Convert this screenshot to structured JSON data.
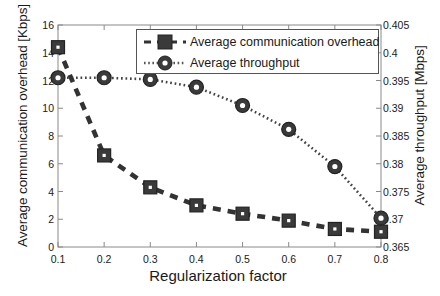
{
  "chart_data": {
    "type": "line",
    "title": "",
    "xlabel": "Regularization factor",
    "ylabel": "Average communication overhead [Kbps]",
    "ylabel_right": "Average throughput [Mbps]",
    "x": [
      0.1,
      0.2,
      0.3,
      0.4,
      0.5,
      0.6,
      0.7,
      0.8
    ],
    "xlim": [
      0.1,
      0.8
    ],
    "ylim": [
      0,
      16
    ],
    "ylim_right": [
      0.365,
      0.405
    ],
    "xticks": [
      "0.1",
      "0.2",
      "0.3",
      "0.4",
      "0.5",
      "0.6",
      "0.7",
      "0.8"
    ],
    "yticks_left": [
      "0",
      "2",
      "4",
      "6",
      "8",
      "10",
      "12",
      "14",
      "16"
    ],
    "yticks_right": [
      "0.365",
      "0.37",
      "0.375",
      "0.38",
      "0.385",
      "0.39",
      "0.395",
      "0.4",
      "0.405"
    ],
    "grid": false,
    "legend_position": "top-center",
    "series": [
      {
        "name": "Average communication overhead",
        "axis": "left",
        "marker": "square",
        "linestyle": "dashed",
        "color": "#333333",
        "values": [
          14.4,
          6.6,
          4.3,
          3.0,
          2.4,
          1.9,
          1.3,
          1.1
        ]
      },
      {
        "name": "Average throughput",
        "axis": "right",
        "marker": "circle",
        "linestyle": "dotted",
        "color": "#444444",
        "values": [
          0.3955,
          0.3955,
          0.3952,
          0.3938,
          0.3905,
          0.3862,
          0.3795,
          0.3702
        ]
      }
    ]
  },
  "legend": {
    "items": [
      {
        "label": "Average communication overhead"
      },
      {
        "label": "Average throughput"
      }
    ]
  }
}
